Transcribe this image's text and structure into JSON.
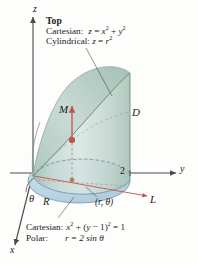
{
  "figure": {
    "background_color": "#fdfdfc",
    "ink_color": "#1b1b1b",
    "surface_color": "#b8cfc6",
    "surface_color_light": "#cfdedb",
    "disk_color": "#bcd5e2",
    "accent_color": "#c2524a",
    "axis_color": "#4a4a4a"
  },
  "top_annotation": {
    "header": "Top",
    "cartesian_label": "Cartesian:",
    "cartesian_eq_lhs": "z",
    "cartesian_eq_rel": "=",
    "cartesian_eq_term1_base": "x",
    "cartesian_eq_term1_exp": "2",
    "cartesian_eq_plus": "+",
    "cartesian_eq_term2_base": "y",
    "cartesian_eq_term2_exp": "2",
    "cylindrical_label": "Cylindrical:",
    "cylindrical_eq_lhs": "z",
    "cylindrical_eq_rel": "=",
    "cylindrical_eq_base": "r",
    "cylindrical_eq_exp": "2"
  },
  "bottom_annotation": {
    "cartesian_label": "Cartesian:",
    "cartesian_eq_x_base": "x",
    "cartesian_eq_x_exp": "2",
    "cartesian_eq_plus": "+",
    "cartesian_eq_paren_open": "(",
    "cartesian_eq_y": "y",
    "cartesian_eq_minus": "−",
    "cartesian_eq_one": "1",
    "cartesian_eq_paren_close": ")",
    "cartesian_eq_paren_exp": "2",
    "cartesian_eq_equals": "= 1",
    "polar_label": "Polar:",
    "polar_eq": "r = 2 sin θ"
  },
  "axis_labels": {
    "z": "z",
    "y": "y",
    "x": "x"
  },
  "point_labels": {
    "M": "M",
    "D": "D",
    "L": "L",
    "R": "R",
    "theta": "θ",
    "tick_two": "2",
    "polar_point": "(r, θ)"
  }
}
